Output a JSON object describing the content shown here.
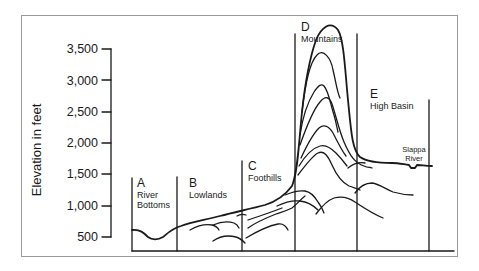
{
  "diagram": {
    "y_axis_label": "Elevation in feet",
    "y_ticks": [
      "3,500",
      "3,000",
      "2,500",
      "2,000",
      "1,500",
      "1,000",
      "500"
    ],
    "regions": [
      {
        "letter": "A",
        "name_line1": "River",
        "name_line2": "Bottoms"
      },
      {
        "letter": "B",
        "name_line1": "Lowlands",
        "name_line2": ""
      },
      {
        "letter": "C",
        "name_line1": "Foothills",
        "name_line2": ""
      },
      {
        "letter": "D",
        "name_line1": "Mountains",
        "name_line2": ""
      },
      {
        "letter": "E",
        "name_line1": "High Basin",
        "name_line2": ""
      }
    ],
    "river": {
      "line1": "Slappa",
      "line2": "River"
    },
    "colors": {
      "line": "#1a1a1a",
      "frame": "#9a9a9a",
      "background": "#ffffff"
    }
  }
}
